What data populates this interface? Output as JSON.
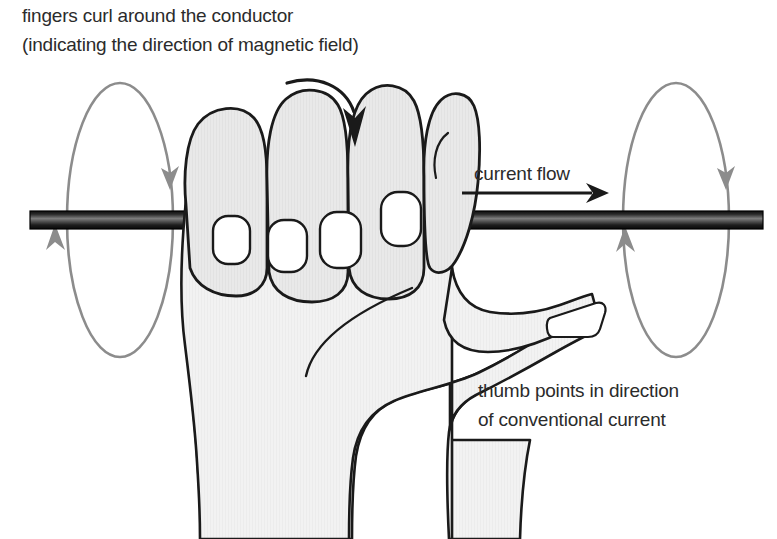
{
  "diagram": {
    "background_color": "#ffffff",
    "text_color": "#2b2b2b",
    "hand_fill_color": "#e6e6e6",
    "hand_outline_color": "#1a1a1a",
    "nail_fill_color": "#ffffff",
    "field_loop_color": "#8c8c8c",
    "conductor_dark_color": "#111111",
    "conductor_light_color": "#8f8f8f",
    "arrow_color": "#1a1a1a"
  },
  "labels": {
    "fingers_note": {
      "line1": "fingers curl around the conductor",
      "line2": "(indicating the direction of magnetic field)"
    },
    "current_flow": "current flow",
    "thumb_note": {
      "line1": "thumb points in direction",
      "line2": "of conventional current"
    }
  },
  "elements": {
    "conductor_name": "conductor-rod",
    "hand_name": "right-hand-gripping-conductor",
    "left_field_loop_name": "magnetic-field-loop-left",
    "right_field_loop_name": "magnetic-field-loop-right",
    "current_arrow_name": "current-flow-arrow",
    "curl_arrow_name": "finger-curl-arrow"
  }
}
